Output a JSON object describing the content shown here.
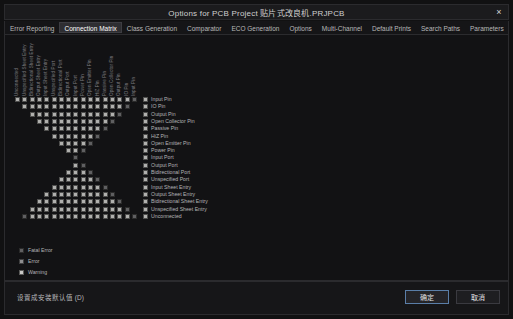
{
  "window": {
    "title": "Options for PCB Project 贴片式改良机.PRJPCB",
    "close_icon": "×"
  },
  "tabs": {
    "items": [
      {
        "label": "Error Reporting",
        "active": false
      },
      {
        "label": "Connection Matrix",
        "active": true
      },
      {
        "label": "Class Generation",
        "active": false
      },
      {
        "label": "Comparator",
        "active": false
      },
      {
        "label": "ECO Generation",
        "active": false
      },
      {
        "label": "Options",
        "active": false
      },
      {
        "label": "Multi-Channel",
        "active": false
      },
      {
        "label": "Default Prints",
        "active": false
      },
      {
        "label": "Search Paths",
        "active": false
      },
      {
        "label": "Parameters",
        "active": false
      },
      {
        "label": "Server Parameters",
        "active": false
      },
      {
        "label": "De",
        "active": false
      }
    ],
    "scroll_left_icon": "◄",
    "scroll_right_icon": "►"
  },
  "matrix": {
    "row_labels": [
      "Input Pin",
      "IO Pin",
      "Output Pin",
      "Open Collector Pin",
      "Passive Pin",
      "HiZ Pin",
      "Open Emitter Pin",
      "Power Pin",
      "Input Port",
      "Output Port",
      "Bidirectional Port",
      "Unspecified Port",
      "Input Sheet Entry",
      "Output Sheet Entry",
      "Bidirectional Sheet Entry",
      "Unspecified Sheet Entry",
      "Unconnected"
    ],
    "column_labels": [
      "Unconnected",
      "Unspecified Sheet Entry",
      "Bidirectional Sheet Entry",
      "Output Sheet Entry",
      "Input Sheet Entry",
      "Unspecified Port",
      "Bidirectional Port",
      "Output Port",
      "Input Port",
      "Power Pin",
      "Open Emitter Pin",
      "HiZ Pin",
      "Passive Pin",
      "Open Collector Pin",
      "Output Pin",
      "IO Pin",
      "Input Pin"
    ],
    "severity_colors": {
      "fatal_error": "#5f5f61",
      "error": "#8e8e90",
      "warning": "#c9c9c7",
      "no_report": "#b0b0ae"
    },
    "cells": [
      [
        4,
        4,
        4,
        4,
        4,
        4,
        4,
        4,
        4,
        4,
        4,
        4,
        4,
        4,
        4,
        4,
        3
      ],
      [
        0,
        4,
        4,
        4,
        4,
        4,
        4,
        4,
        4,
        4,
        4,
        4,
        4,
        4,
        4,
        3,
        0
      ],
      [
        0,
        0,
        4,
        4,
        4,
        4,
        4,
        4,
        4,
        4,
        4,
        4,
        4,
        4,
        3,
        0,
        0
      ],
      [
        0,
        0,
        0,
        4,
        4,
        4,
        4,
        4,
        4,
        4,
        4,
        4,
        4,
        3,
        0,
        0,
        0
      ],
      [
        0,
        0,
        0,
        0,
        4,
        4,
        4,
        4,
        4,
        4,
        4,
        4,
        3,
        0,
        0,
        0,
        0
      ],
      [
        0,
        0,
        0,
        0,
        0,
        4,
        4,
        4,
        4,
        4,
        4,
        3,
        0,
        0,
        0,
        0,
        0
      ],
      [
        0,
        0,
        0,
        0,
        0,
        0,
        4,
        4,
        4,
        4,
        3,
        0,
        0,
        0,
        0,
        0,
        0
      ],
      [
        0,
        0,
        0,
        0,
        0,
        0,
        0,
        4,
        4,
        3,
        0,
        0,
        0,
        0,
        0,
        0,
        0
      ],
      [
        0,
        0,
        0,
        0,
        0,
        0,
        0,
        0,
        3,
        0,
        0,
        0,
        0,
        0,
        0,
        0,
        0
      ],
      [
        0,
        0,
        0,
        0,
        0,
        0,
        0,
        0,
        4,
        3,
        0,
        0,
        0,
        0,
        0,
        0,
        0
      ],
      [
        0,
        0,
        0,
        0,
        0,
        0,
        0,
        4,
        4,
        4,
        3,
        0,
        0,
        0,
        0,
        0,
        0
      ],
      [
        0,
        0,
        0,
        0,
        0,
        0,
        4,
        4,
        4,
        4,
        4,
        3,
        0,
        0,
        0,
        0,
        0
      ],
      [
        0,
        0,
        0,
        0,
        0,
        4,
        4,
        4,
        4,
        4,
        4,
        4,
        3,
        0,
        0,
        0,
        0
      ],
      [
        0,
        0,
        0,
        0,
        4,
        4,
        4,
        4,
        4,
        4,
        4,
        4,
        4,
        3,
        0,
        0,
        0
      ],
      [
        0,
        0,
        0,
        4,
        4,
        4,
        4,
        4,
        4,
        4,
        4,
        4,
        4,
        4,
        3,
        0,
        0
      ],
      [
        0,
        0,
        4,
        4,
        4,
        4,
        4,
        4,
        4,
        4,
        4,
        4,
        4,
        4,
        4,
        3,
        0
      ],
      [
        0,
        3,
        4,
        4,
        4,
        4,
        4,
        4,
        4,
        4,
        4,
        4,
        4,
        4,
        4,
        4,
        3
      ]
    ]
  },
  "legend": {
    "items": [
      {
        "label": "Fatal Error",
        "color_key": "fatal_error"
      },
      {
        "label": "Error",
        "color_key": "error"
      },
      {
        "label": "Warning",
        "color_key": "warning"
      },
      {
        "label": "No Report",
        "color_key": "no_report"
      }
    ]
  },
  "footer": {
    "defaults_label": "设置成安装默认值 (D)",
    "ok_label": "确定",
    "cancel_label": "取消"
  }
}
